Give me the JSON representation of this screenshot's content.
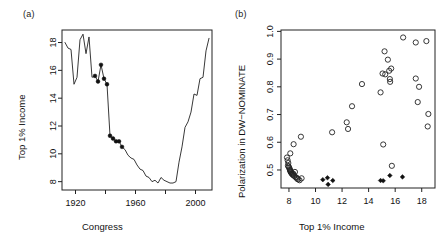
{
  "figure": {
    "background": "#ffffff",
    "ink": "#1a1a1a",
    "width": 447,
    "height": 247
  },
  "panel_a": {
    "tag": "(a)",
    "xlabel": "Congress",
    "ylabel": "Top 1% Income"
  },
  "panel_b": {
    "tag": "(b)",
    "xlabel": "Top 1% Income",
    "ylabel": "Polarization in DW−NOMINATE"
  },
  "chart_data": [
    {
      "type": "line",
      "panel": "(a)",
      "title": "",
      "xlabel": "Congress",
      "ylabel": "Top 1% Income",
      "xlim": [
        1911,
        2011
      ],
      "ylim": [
        7.4,
        18.9
      ],
      "xticks": [
        1920,
        1940,
        1960,
        1980,
        2000
      ],
      "xtick_labels": [
        "1920",
        "",
        "1960",
        "",
        "2000"
      ],
      "yticks": [
        8,
        10,
        12,
        14,
        16,
        18
      ],
      "ytick_labels": [
        "8",
        "10",
        "12",
        "14",
        "16",
        "18"
      ],
      "grid": false,
      "legend": "none",
      "x": [
        1913,
        1915,
        1917,
        1919,
        1921,
        1923,
        1925,
        1927,
        1929,
        1931,
        1933,
        1935,
        1937,
        1939,
        1941,
        1943,
        1945,
        1947,
        1949,
        1951,
        1953,
        1955,
        1957,
        1959,
        1961,
        1963,
        1965,
        1967,
        1969,
        1971,
        1973,
        1975,
        1977,
        1979,
        1981,
        1983,
        1985,
        1987,
        1989,
        1991,
        1993,
        1995,
        1997,
        1999,
        2001,
        2003,
        2005,
        2007,
        2009
      ],
      "y": [
        18.0,
        17.6,
        17.5,
        15.0,
        15.5,
        18.2,
        18.6,
        17.2,
        18.4,
        15.5,
        15.6,
        15.2,
        16.4,
        15.4,
        15.0,
        11.3,
        11.1,
        10.9,
        10.9,
        10.5,
        10.3,
        9.9,
        9.7,
        9.6,
        9.2,
        8.9,
        8.8,
        8.4,
        8.3,
        8.0,
        8.1,
        7.9,
        8.3,
        8.1,
        8.0,
        7.9,
        7.9,
        8.0,
        9.4,
        10.5,
        11.9,
        12.3,
        13.0,
        14.3,
        14.2,
        15.4,
        15.5,
        17.4,
        18.3
      ],
      "highlighted_points": {
        "marker": "filled-circle",
        "x": [
          1933,
          1935,
          1937,
          1939,
          1941,
          1943,
          1945,
          1947,
          1949,
          1951
        ],
        "y": [
          15.6,
          15.2,
          16.4,
          15.4,
          15.0,
          11.3,
          11.1,
          10.9,
          10.9,
          10.5
        ]
      }
    },
    {
      "type": "scatter",
      "panel": "(b)",
      "title": "",
      "xlabel": "Top 1% Income",
      "ylabel": "Polarization in DW−NOMINATE",
      "xlim": [
        7.4,
        19.0
      ],
      "ylim": [
        0.435,
        1.005
      ],
      "xticks": [
        8,
        10,
        12,
        14,
        16,
        18
      ],
      "xtick_labels": [
        "8",
        "10",
        "12",
        "14",
        "16",
        "18"
      ],
      "yticks": [
        0.5,
        0.6,
        0.7,
        0.8,
        0.9,
        1.0
      ],
      "ytick_labels": [
        "0.5",
        "0.6",
        "0.7",
        "0.8",
        "0.9",
        "1.0"
      ],
      "grid": false,
      "legend": "none",
      "series": [
        {
          "name": "Other congresses",
          "marker": "open-circle",
          "points": [
            [
              7.85,
              0.545
            ],
            [
              7.9,
              0.535
            ],
            [
              7.95,
              0.525
            ],
            [
              7.92,
              0.515
            ],
            [
              7.98,
              0.512
            ],
            [
              8.02,
              0.508
            ],
            [
              8.05,
              0.503
            ],
            [
              8.08,
              0.5
            ],
            [
              8.1,
              0.497
            ],
            [
              8.12,
              0.494
            ],
            [
              8.15,
              0.492
            ],
            [
              8.18,
              0.489
            ],
            [
              8.22,
              0.486
            ],
            [
              8.28,
              0.483
            ],
            [
              8.32,
              0.487
            ],
            [
              8.35,
              0.481
            ],
            [
              8.4,
              0.478
            ],
            [
              8.45,
              0.493
            ],
            [
              8.5,
              0.474
            ],
            [
              8.58,
              0.472
            ],
            [
              8.62,
              0.468
            ],
            [
              8.7,
              0.466
            ],
            [
              8.8,
              0.463
            ],
            [
              8.95,
              0.47
            ],
            [
              8.35,
              0.593
            ],
            [
              8.9,
              0.62
            ],
            [
              8.1,
              0.56
            ],
            [
              11.25,
              0.636
            ],
            [
              12.35,
              0.672
            ],
            [
              12.45,
              0.648
            ],
            [
              12.75,
              0.73
            ],
            [
              13.5,
              0.81
            ],
            [
              14.9,
              0.78
            ],
            [
              15.05,
              0.848
            ],
            [
              15.2,
              0.928
            ],
            [
              15.25,
              0.845
            ],
            [
              15.45,
              0.898
            ],
            [
              15.55,
              0.858
            ],
            [
              15.6,
              0.828
            ],
            [
              15.62,
              0.818
            ],
            [
              15.7,
              0.866
            ],
            [
              15.1,
              0.592
            ],
            [
              15.75,
              0.515
            ],
            [
              16.6,
              0.978
            ],
            [
              17.55,
              0.96
            ],
            [
              17.55,
              0.83
            ],
            [
              17.8,
              0.8
            ],
            [
              17.7,
              0.745
            ],
            [
              18.35,
              0.965
            ],
            [
              18.5,
              0.702
            ],
            [
              18.45,
              0.657
            ]
          ]
        },
        {
          "name": "Highlighted congresses (1933–1951)",
          "marker": "filled-diamond",
          "points": [
            [
              10.55,
              0.465
            ],
            [
              10.9,
              0.472
            ],
            [
              10.95,
              0.448
            ],
            [
              11.3,
              0.462
            ],
            [
              14.9,
              0.462
            ],
            [
              15.1,
              0.461
            ],
            [
              15.6,
              0.48
            ],
            [
              16.55,
              0.475
            ]
          ]
        }
      ]
    }
  ]
}
